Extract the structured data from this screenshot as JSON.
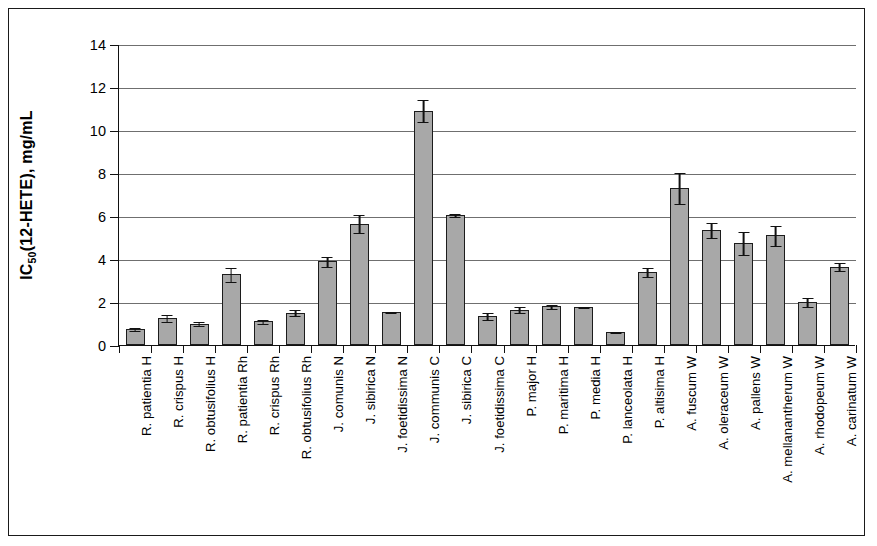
{
  "chart_data": {
    "type": "bar",
    "title": "",
    "xlabel": "",
    "ylabel": "IC50(12-HETE), mg/mL",
    "ylabel_parts": {
      "prefix": "IC",
      "sub": "50",
      "suffix": "(12-HETE), mg/mL"
    },
    "ylim": [
      0,
      14
    ],
    "ytick_values": [
      0,
      2,
      4,
      6,
      8,
      10,
      12,
      14
    ],
    "ytick_labels": [
      "0",
      "2",
      "4",
      "6",
      "8",
      "10",
      "12",
      "14"
    ],
    "grid": true,
    "legend": "none",
    "bar_color": "#a8a8a8",
    "bar_edge_color": "#1c1c1c",
    "error_bar_color": "#111111",
    "categories": [
      "R. patientia H",
      "R. crispus H",
      "R. obtusifolius H",
      "R. patientia Rh",
      "R. crispus Rh",
      "R. obtusifolius Rh",
      "J. comunis N",
      "J. sibirica N",
      "J. foetidissima N",
      "J. communis C",
      "J. sibirica C",
      "J. foetidissima C",
      "P. major H",
      "P. maritima H",
      "P. media H",
      "P. lanceolata H",
      "P. altisima H",
      "A. fuscum W",
      "A. oleraceum W",
      "A. pallens W",
      "A. mellanantherum W",
      "A. rhodopeum W",
      "A. carinatum W"
    ],
    "values": [
      0.75,
      1.25,
      1.0,
      3.3,
      1.1,
      1.5,
      3.9,
      5.65,
      1.55,
      10.9,
      6.05,
      1.35,
      1.65,
      1.8,
      1.75,
      0.6,
      3.4,
      7.3,
      5.35,
      4.75,
      5.1,
      2.0,
      3.65
    ],
    "errors": [
      0.08,
      0.18,
      0.1,
      0.35,
      0.1,
      0.17,
      0.25,
      0.45,
      0.05,
      0.55,
      0.1,
      0.2,
      0.18,
      0.12,
      0.05,
      0.05,
      0.25,
      0.75,
      0.35,
      0.55,
      0.5,
      0.22,
      0.2
    ]
  }
}
